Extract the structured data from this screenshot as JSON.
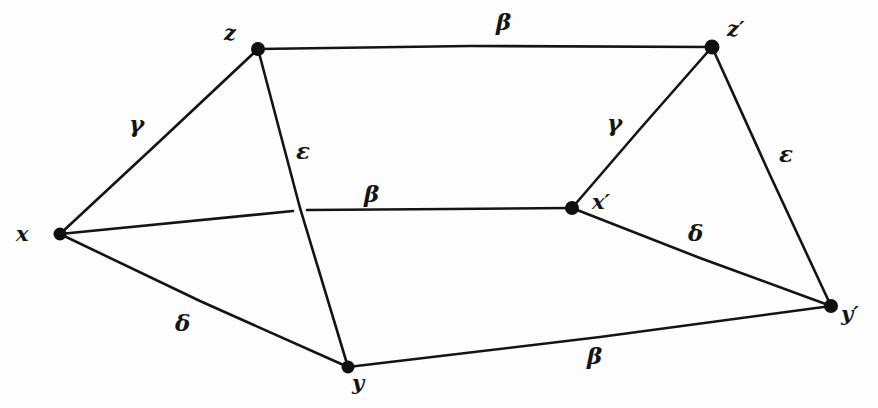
{
  "diagram": {
    "background_color": "#fdfdfd",
    "ink_color": "#141414",
    "vertices": [
      {
        "id": "x",
        "label": "x",
        "x": 60,
        "y": 234,
        "label_x": 16,
        "label_y": 223
      },
      {
        "id": "y",
        "label": "y",
        "x": 348,
        "y": 367,
        "label_x": 352,
        "label_y": 372
      },
      {
        "id": "z",
        "label": "z",
        "x": 258,
        "y": 49,
        "label_x": 224,
        "label_y": 22
      },
      {
        "id": "xp",
        "label": "x′",
        "x": 572,
        "y": 208,
        "label_x": 592,
        "label_y": 191
      },
      {
        "id": "yp",
        "label": "y′",
        "x": 831,
        "y": 306,
        "label_x": 841,
        "label_y": 303
      },
      {
        "id": "zp",
        "label": "z′",
        "x": 712,
        "y": 47,
        "label_x": 727,
        "label_y": 18
      }
    ],
    "edges": [
      {
        "id": "z-zp",
        "from": "z",
        "to": "zp",
        "label": "β",
        "label_x": 496,
        "label_y": 10
      },
      {
        "id": "x-z",
        "from": "x",
        "to": "z",
        "label": "γ",
        "label_x": 129,
        "label_y": 112
      },
      {
        "id": "z-y",
        "from": "z",
        "to": "y",
        "label": "ε",
        "label_x": 296,
        "label_y": 139
      },
      {
        "id": "x-xp",
        "from": "x",
        "to": "xp",
        "label": "β",
        "label_x": 364,
        "label_y": 182
      },
      {
        "id": "x-y",
        "from": "x",
        "to": "y",
        "label": "δ",
        "label_x": 175,
        "label_y": 311
      },
      {
        "id": "y-yp",
        "from": "y",
        "to": "yp",
        "label": "β",
        "label_x": 587,
        "label_y": 344
      },
      {
        "id": "xp-zp",
        "from": "xp",
        "to": "zp",
        "label": "γ",
        "label_x": 607,
        "label_y": 111
      },
      {
        "id": "zp-yp",
        "from": "zp",
        "to": "yp",
        "label": "ε",
        "label_x": 779,
        "label_y": 142
      },
      {
        "id": "xp-yp",
        "from": "xp",
        "to": "yp",
        "label": "δ",
        "label_x": 688,
        "label_y": 221
      }
    ]
  }
}
